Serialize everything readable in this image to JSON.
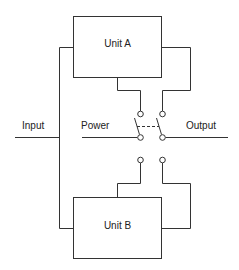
{
  "diagram": {
    "units": [
      {
        "id": "unit-a",
        "label": "Unit A"
      },
      {
        "id": "unit-b",
        "label": "Unit B"
      }
    ],
    "labels": {
      "input": "Input",
      "power": "Power",
      "output": "Output"
    },
    "colors": {
      "line": "#333333",
      "background": "#ffffff"
    }
  }
}
